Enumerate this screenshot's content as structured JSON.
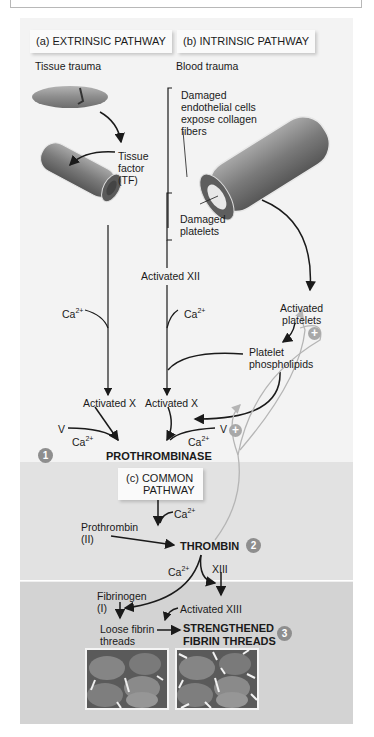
{
  "figure": {
    "top_caption_box": "",
    "sections": {
      "extrinsic": {
        "header": "(a) EXTRINSIC PATHWAY",
        "trigger": "Tissue trauma",
        "tissue_factor": "Tissue factor (TF)",
        "ca": "Ca",
        "ca_sup": "2+",
        "activated_x": "Activated X"
      },
      "intrinsic": {
        "header": "(b) INTRINSIC PATHWAY",
        "trigger": "Blood trauma",
        "damaged_endothelial": [
          "Damaged",
          "endothelial cells",
          "expose collagen",
          "fibers"
        ],
        "damaged_platelets": [
          "Damaged",
          "platelets"
        ],
        "activated_xii": "Activated XII",
        "ca": "Ca",
        "ca_sup": "2+",
        "activated_platelets": [
          "Activated",
          "platelets"
        ],
        "platelet_phospholipids": [
          "Platelet",
          "phospholipids"
        ],
        "activated_x": "Activated X"
      },
      "prothrombinase": {
        "v_left": "V",
        "v_right": "V",
        "ca": "Ca",
        "ca_sup": "2+",
        "label": "PROTHROMBINASE",
        "step": "1"
      },
      "common": {
        "header_line1": "(c) COMMON",
        "header_line2": "PATHWAY",
        "ca": "Ca",
        "ca_sup": "2+",
        "prothrombin": [
          "Prothrombin",
          "(II)"
        ],
        "thrombin": "THROMBIN",
        "step": "2",
        "xiii": "XIII"
      },
      "fibrin": {
        "fibrinogen": [
          "Fibrinogen",
          "(I)"
        ],
        "activated_xiii": "Activated XIII",
        "loose_fibrin": [
          "Loose fibrin",
          "threads"
        ],
        "strengthened": [
          "STRENGTHENED",
          "FIBRIN THREADS"
        ],
        "step": "3"
      }
    },
    "plus_symbol": "+",
    "colors": {
      "panel_top": "#f3f3f3",
      "panel_common": "#e2e2e2",
      "panel_fibrin": "#d3d3d3",
      "step_badge": "#8e8e8e",
      "feedback_arrow": "#b5b5b5"
    }
  }
}
